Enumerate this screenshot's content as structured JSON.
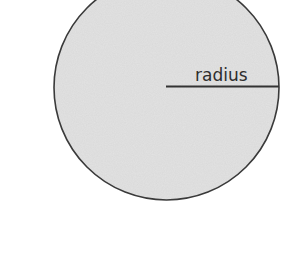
{
  "diagram": {
    "type": "circle-with-radius",
    "label": "radius",
    "colors": {
      "background": "#ffffff",
      "fill": "#e3e3e3",
      "outline": "#3a3a3a",
      "radius_line": "#333333",
      "text": "#2e2e2e"
    },
    "circle": {
      "cx": 166.5,
      "cy": 87.5,
      "r": 112.5
    },
    "radius_line": {
      "x1": 166,
      "y1": 86.5,
      "x2": 279,
      "y2": 86.5
    }
  }
}
